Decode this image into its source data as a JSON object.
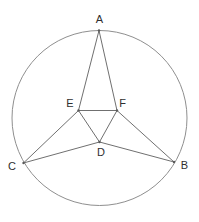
{
  "diagram": {
    "width": 199,
    "height": 222,
    "background": "#ffffff",
    "circle": {
      "cx": 99.5,
      "cy": 118,
      "r": 87.5,
      "stroke": "#8f8f8f",
      "stroke_width": 1
    },
    "segment_stroke": "#707070",
    "segment_stroke_width": 1,
    "dot_color": "#5a5a5a",
    "dot_radius": 1.2,
    "label_color": "#2f2f2f",
    "label_font_size": 11,
    "points": {
      "A": {
        "x": 99,
        "y": 30.5,
        "label": "A",
        "label_x": 99.5,
        "label_y": 23,
        "on_circle": true
      },
      "B": {
        "x": 174,
        "y": 162,
        "label": "B",
        "label_x": 184.5,
        "label_y": 169,
        "on_circle": true
      },
      "C": {
        "x": 23.5,
        "y": 163,
        "label": "C",
        "label_x": 12,
        "label_y": 170,
        "on_circle": true
      },
      "D": {
        "x": 99.5,
        "y": 142,
        "label": "D",
        "label_x": 101,
        "label_y": 156,
        "on_circle": false
      },
      "E": {
        "x": 78.5,
        "y": 110.5,
        "label": "E",
        "label_x": 70,
        "label_y": 107,
        "on_circle": false
      },
      "F": {
        "x": 117,
        "y": 110.5,
        "label": "F",
        "label_x": 122.5,
        "label_y": 107,
        "on_circle": false
      }
    },
    "segments": [
      [
        "A",
        "E"
      ],
      [
        "A",
        "F"
      ],
      [
        "E",
        "F"
      ],
      [
        "E",
        "D"
      ],
      [
        "F",
        "D"
      ],
      [
        "C",
        "E"
      ],
      [
        "C",
        "D"
      ],
      [
        "F",
        "B"
      ],
      [
        "D",
        "B"
      ]
    ]
  }
}
